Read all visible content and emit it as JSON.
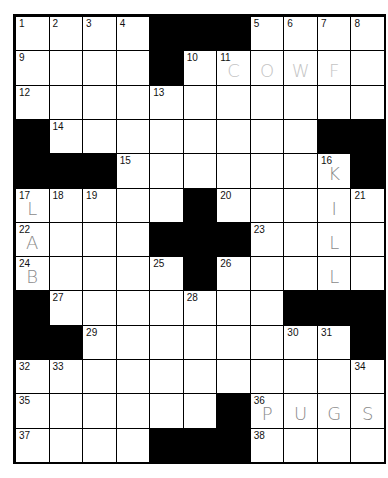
{
  "puzzle": {
    "rows": 13,
    "cols": 11,
    "layout": [
      "....###....",
      "....#......",
      "...........",
      "#........##",
      "###.......#",
      ".....#.....",
      "....###....",
      ".....#.....",
      "#.......###",
      "##........#",
      "...........",
      "......#....",
      "....###...."
    ],
    "numbers": [
      {
        "r": 0,
        "c": 0,
        "n": "1"
      },
      {
        "r": 0,
        "c": 1,
        "n": "2"
      },
      {
        "r": 0,
        "c": 2,
        "n": "3"
      },
      {
        "r": 0,
        "c": 3,
        "n": "4"
      },
      {
        "r": 0,
        "c": 7,
        "n": "5"
      },
      {
        "r": 0,
        "c": 8,
        "n": "6"
      },
      {
        "r": 0,
        "c": 9,
        "n": "7"
      },
      {
        "r": 0,
        "c": 10,
        "n": "8"
      },
      {
        "r": 1,
        "c": 0,
        "n": "9"
      },
      {
        "r": 1,
        "c": 5,
        "n": "10"
      },
      {
        "r": 1,
        "c": 6,
        "n": "11"
      },
      {
        "r": 2,
        "c": 0,
        "n": "12"
      },
      {
        "r": 2,
        "c": 4,
        "n": "13"
      },
      {
        "r": 3,
        "c": 1,
        "n": "14"
      },
      {
        "r": 4,
        "c": 3,
        "n": "15"
      },
      {
        "r": 4,
        "c": 9,
        "n": "16"
      },
      {
        "r": 5,
        "c": 0,
        "n": "17"
      },
      {
        "r": 5,
        "c": 1,
        "n": "18"
      },
      {
        "r": 5,
        "c": 2,
        "n": "19"
      },
      {
        "r": 5,
        "c": 6,
        "n": "20"
      },
      {
        "r": 5,
        "c": 10,
        "n": "21"
      },
      {
        "r": 6,
        "c": 0,
        "n": "22"
      },
      {
        "r": 6,
        "c": 7,
        "n": "23"
      },
      {
        "r": 7,
        "c": 0,
        "n": "24"
      },
      {
        "r": 7,
        "c": 4,
        "n": "25"
      },
      {
        "r": 7,
        "c": 6,
        "n": "26"
      },
      {
        "r": 8,
        "c": 1,
        "n": "27"
      },
      {
        "r": 8,
        "c": 5,
        "n": "28"
      },
      {
        "r": 9,
        "c": 2,
        "n": "29"
      },
      {
        "r": 9,
        "c": 8,
        "n": "30"
      },
      {
        "r": 9,
        "c": 9,
        "n": "31"
      },
      {
        "r": 10,
        "c": 0,
        "n": "32"
      },
      {
        "r": 10,
        "c": 1,
        "n": "33"
      },
      {
        "r": 10,
        "c": 10,
        "n": "34"
      },
      {
        "r": 11,
        "c": 0,
        "n": "35"
      },
      {
        "r": 11,
        "c": 7,
        "n": "36"
      },
      {
        "r": 12,
        "c": 0,
        "n": "37"
      },
      {
        "r": 12,
        "c": 7,
        "n": "38"
      }
    ],
    "entries": [
      {
        "r": 1,
        "c": 6,
        "ch": "C",
        "style": "light"
      },
      {
        "r": 1,
        "c": 7,
        "ch": "O",
        "style": "light"
      },
      {
        "r": 1,
        "c": 8,
        "ch": "W",
        "style": "light"
      },
      {
        "r": 1,
        "c": 9,
        "ch": "F",
        "style": "light"
      },
      {
        "r": 4,
        "c": 9,
        "ch": "K",
        "style": "pen"
      },
      {
        "r": 5,
        "c": 9,
        "ch": "I",
        "style": "pen"
      },
      {
        "r": 6,
        "c": 9,
        "ch": "L",
        "style": "pen"
      },
      {
        "r": 7,
        "c": 9,
        "ch": "L",
        "style": "pen"
      },
      {
        "r": 5,
        "c": 0,
        "ch": "L",
        "style": "pen"
      },
      {
        "r": 6,
        "c": 0,
        "ch": "A",
        "style": "pen"
      },
      {
        "r": 7,
        "c": 0,
        "ch": "B",
        "style": "pen"
      },
      {
        "r": 11,
        "c": 7,
        "ch": "P",
        "style": "pen"
      },
      {
        "r": 11,
        "c": 8,
        "ch": "U",
        "style": "pen"
      },
      {
        "r": 11,
        "c": 9,
        "ch": "G",
        "style": "pen"
      },
      {
        "r": 11,
        "c": 10,
        "ch": "S",
        "style": "pen"
      }
    ]
  },
  "colors": {
    "block": "#000000",
    "cell": "#ffffff",
    "pen": "#8a8a8a",
    "pencil_light": "#c4c4c4"
  }
}
